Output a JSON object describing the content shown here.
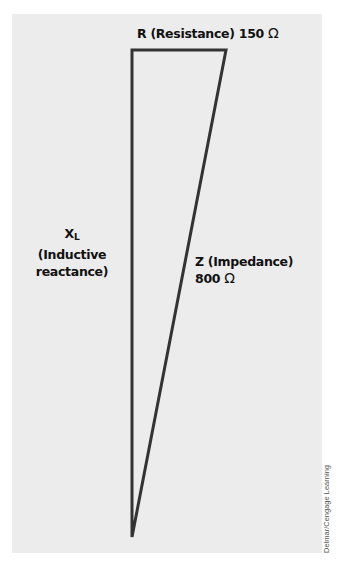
{
  "diagram": {
    "resistance": {
      "label": "R (Resistance)",
      "value": "150",
      "unit": "Ω"
    },
    "reactance": {
      "symbol": "X",
      "subscript": "L",
      "line1": "(Inductive",
      "line2": "reactance)"
    },
    "impedance": {
      "label": "Z (Impedance)",
      "value": "800",
      "unit": "Ω"
    },
    "vertices": {
      "top_left": [
        132,
        50
      ],
      "top_right": [
        226,
        50
      ],
      "bottom": [
        132,
        537
      ]
    },
    "colors": {
      "background": "#ececec",
      "stroke": "#333333",
      "text": "#111111"
    }
  },
  "credit": "Delmar/Cengage Learning"
}
